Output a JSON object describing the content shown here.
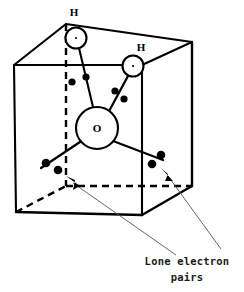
{
  "figure": {
    "background_color": "#ffffff",
    "line_color": "#000000",
    "leader_color": "#555555",
    "width": 244,
    "height": 292
  },
  "atoms": [
    {
      "id": "h1",
      "label": "H",
      "element": "H",
      "cx": 76,
      "cy": 38,
      "r": 10.5,
      "label_x": 74,
      "label_y": 16
    },
    {
      "id": "h2",
      "label": "H",
      "element": "H",
      "cx": 133,
      "cy": 66,
      "r": 10.5,
      "label_x": 141,
      "label_y": 51
    },
    {
      "id": "o",
      "label": "O",
      "element": "O",
      "cx": 97,
      "cy": 128,
      "r": 21,
      "label_x": 97,
      "label_y": 132
    }
  ],
  "bonds": [
    {
      "id": "bond-o-h1",
      "from": "o",
      "to": "h1",
      "x1": 93,
      "y1": 107,
      "x2": 79,
      "y2": 48
    },
    {
      "id": "bond-o-h2",
      "from": "o",
      "to": "h2",
      "x1": 108,
      "y1": 113,
      "x2": 128,
      "y2": 76
    },
    {
      "id": "bond-o-lone-left",
      "from": "o",
      "to": "lone-pair-left",
      "x1": 80,
      "y1": 142,
      "x2": 41,
      "y2": 168
    },
    {
      "id": "bond-o-lone-right",
      "from": "o",
      "to": "lone-pair-right",
      "x1": 113,
      "y1": 141,
      "x2": 160,
      "y2": 160
    }
  ],
  "electron_pairs": [
    {
      "id": "bonding-pair-h1",
      "kind": "bonding",
      "dots": [
        {
          "cx": 72,
          "cy": 82,
          "r": 3.6
        },
        {
          "cx": 86,
          "cy": 77,
          "r": 3.6
        }
      ]
    },
    {
      "id": "bonding-pair-h2",
      "kind": "bonding",
      "dots": [
        {
          "cx": 115,
          "cy": 91,
          "r": 3.6
        },
        {
          "cx": 124,
          "cy": 99,
          "r": 3.6
        }
      ]
    },
    {
      "id": "lone-pair-left",
      "kind": "lone",
      "dots": [
        {
          "cx": 46,
          "cy": 163,
          "r": 4.2
        },
        {
          "cx": 58,
          "cy": 170,
          "r": 4.2
        }
      ]
    },
    {
      "id": "lone-pair-right",
      "kind": "lone",
      "dots": [
        {
          "cx": 152,
          "cy": 164,
          "r": 4.2
        },
        {
          "cx": 161,
          "cy": 155,
          "r": 4.2
        }
      ]
    }
  ],
  "cube": {
    "description": "Transparent cube drawn in oblique projection",
    "vertices": {
      "front_top_left": [
        14,
        65
      ],
      "front_top_right": [
        142,
        65
      ],
      "front_bottom_left": [
        16,
        212
      ],
      "front_bottom_right": [
        142,
        215
      ],
      "back_top_left": [
        66,
        24
      ],
      "back_top_right": [
        192,
        42
      ],
      "back_bottom_left": [
        16,
        186
      ],
      "back_bottom_right": [
        192,
        186
      ]
    },
    "solid_edges": [
      "front_top_left-front_top_right",
      "front_top_left-front_bottom_left",
      "front_bottom_left-front_bottom_right",
      "front_top_right-front_bottom_right",
      "front_top_left-back_top_left",
      "front_top_right-back_top_right",
      "back_top_left-back_top_right",
      "back_top_right-back_bottom_right",
      "front_bottom_right-back_bottom_right"
    ],
    "dashed_edges": [
      "back_top_left-back_bottom_left",
      "back_bottom_left-back_bottom_right",
      "front_bottom_left-back_bottom_left"
    ]
  },
  "annotations": {
    "caption": {
      "line1": "Lone electron",
      "line2": "pairs",
      "line1_x": 187,
      "line1_y": 265,
      "line2_x": 187,
      "line2_y": 281
    },
    "leaders": [
      {
        "id": "leader-left",
        "target": "lone-pair-left",
        "x1": 176,
        "y1": 255,
        "x2": 72,
        "y2": 182,
        "arrow_x": 68,
        "arrow_y": 179,
        "arrow_angle": 215
      },
      {
        "id": "leader-right",
        "target": "lone-pair-right",
        "x1": 222,
        "y1": 250,
        "x2": 167,
        "y2": 175,
        "arrow_x": 163,
        "arrow_y": 170,
        "arrow_angle": 234
      }
    ]
  }
}
